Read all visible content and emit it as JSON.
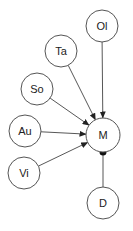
{
  "diagram": {
    "type": "directed-graph",
    "colors": {
      "stroke": "#555555",
      "text": "#222222",
      "background": "#ffffff"
    },
    "nodes": [
      {
        "id": "Ol",
        "label": "Ol",
        "cx": 102,
        "cy": 26,
        "r": 16
      },
      {
        "id": "Ta",
        "label": "Ta",
        "cx": 61,
        "cy": 51,
        "r": 16
      },
      {
        "id": "So",
        "label": "So",
        "cx": 37,
        "cy": 89,
        "r": 16
      },
      {
        "id": "Au",
        "label": "Au",
        "cx": 25,
        "cy": 131,
        "r": 16
      },
      {
        "id": "Vi",
        "label": "Vi",
        "cx": 24,
        "cy": 173,
        "r": 16
      },
      {
        "id": "M",
        "label": "M",
        "cx": 103,
        "cy": 135,
        "r": 17
      },
      {
        "id": "D",
        "label": "D",
        "cx": 103,
        "cy": 203,
        "r": 16
      }
    ],
    "edges": [
      {
        "from": "Ol",
        "to": "M",
        "head": "arrow"
      },
      {
        "from": "Ta",
        "to": "M",
        "head": "arrow"
      },
      {
        "from": "So",
        "to": "M",
        "head": "arrow"
      },
      {
        "from": "Au",
        "to": "M",
        "head": "arrow"
      },
      {
        "from": "Vi",
        "to": "M",
        "head": "arrow"
      },
      {
        "from": "D",
        "to": "M",
        "head": "dot"
      }
    ]
  }
}
